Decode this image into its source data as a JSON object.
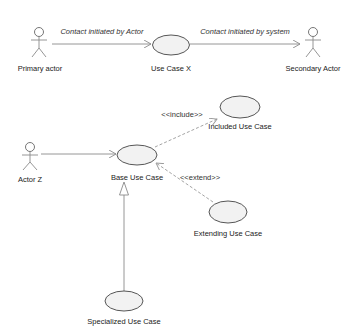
{
  "diagram": {
    "type": "uml-use-case",
    "actors": [
      {
        "id": "primary",
        "label": "Primary actor"
      },
      {
        "id": "secondary",
        "label": "Secondary Actor"
      },
      {
        "id": "actor_z",
        "label": "Actor Z"
      }
    ],
    "use_cases": [
      {
        "id": "uc_x",
        "label": "Use Case X"
      },
      {
        "id": "base",
        "label": "Base Use Case"
      },
      {
        "id": "included",
        "label": "Included Use Case"
      },
      {
        "id": "extending",
        "label": "Extending Use Case"
      },
      {
        "id": "specialized",
        "label": "Specialized Use Case"
      }
    ],
    "relationships": [
      {
        "from": "primary",
        "to": "uc_x",
        "kind": "association",
        "label": "Contact initiated by Actor"
      },
      {
        "from": "uc_x",
        "to": "secondary",
        "kind": "association",
        "label": "Contact initiated by system"
      },
      {
        "from": "actor_z",
        "to": "base",
        "kind": "association",
        "label": ""
      },
      {
        "from": "base",
        "to": "included",
        "kind": "include",
        "label": "<<include>>"
      },
      {
        "from": "extending",
        "to": "base",
        "kind": "extend",
        "label": "<<extend>>"
      },
      {
        "from": "specialized",
        "to": "base",
        "kind": "generalization",
        "label": ""
      }
    ],
    "colors": {
      "line": "#8a8a8a",
      "dashed": "#9a9a9a",
      "ellipse_fill": "#f2f2f2",
      "ellipse_stroke": "#444444",
      "text": "#222222"
    }
  }
}
